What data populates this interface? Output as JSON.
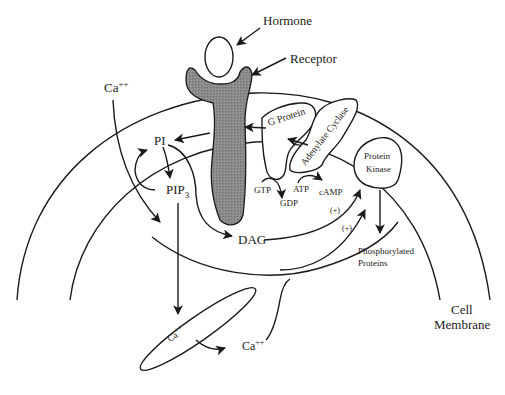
{
  "diagram": {
    "type": "signal-transduction",
    "colors": {
      "ink": "#1a1a1a",
      "receptor_fill": "#8a8a8a",
      "background": "#ffffff"
    },
    "labels": {
      "hormone": "Hormone",
      "receptor": "Receptor",
      "ca_outside": "Ca",
      "ca_outside_sup": "++",
      "pi": "PI",
      "pip": "PIP",
      "pip_sub": "3",
      "g_protein": "G Protein",
      "adenylate_cyclase": "Adenylate Cyclase",
      "gtp": "GTP",
      "gdp": "GDP",
      "atp": "ATP",
      "camp": "cAMP",
      "protein_kinase_line1": "Protein",
      "protein_kinase_line2": "Kinase",
      "plus1": "(+)",
      "plus2": "(+)",
      "dag": "DAG",
      "phosphorylated_line1": "Phosphorylated",
      "phosphorylated_line2": "Proteins",
      "ca_er": "Ca",
      "ca_er_sup": "++",
      "ca_released": "Ca",
      "ca_released_sup": "++",
      "cell_membrane_line1": "Cell",
      "cell_membrane_line2": "Membrane"
    },
    "nodes": [
      {
        "id": "hormone",
        "label": "Hormone"
      },
      {
        "id": "receptor",
        "label": "Receptor"
      },
      {
        "id": "g_protein",
        "label": "G Protein"
      },
      {
        "id": "adenylate_cyclase",
        "label": "Adenylate Cyclase"
      },
      {
        "id": "protein_kinase",
        "label": "Protein Kinase"
      },
      {
        "id": "pi",
        "label": "PI"
      },
      {
        "id": "pip3",
        "label": "PIP3"
      },
      {
        "id": "dag",
        "label": "DAG"
      },
      {
        "id": "er_calcium",
        "label": "Ca++"
      },
      {
        "id": "phosphorylated_proteins",
        "label": "Phosphorylated Proteins"
      }
    ],
    "edges": [
      {
        "from": "hormone",
        "to": "receptor"
      },
      {
        "from": "receptor",
        "to": "pi"
      },
      {
        "from": "adenylate_cyclase",
        "to": "g_protein"
      },
      {
        "from": "g_protein",
        "to": "receptor"
      },
      {
        "from": "pi",
        "to": "pip3"
      },
      {
        "from": "pip3",
        "to": "pi"
      },
      {
        "from": "pip3",
        "to": "dag"
      },
      {
        "from": "pip3",
        "to": "er_calcium"
      },
      {
        "from": "gtp",
        "to": "gdp"
      },
      {
        "from": "atp",
        "to": "camp"
      },
      {
        "from": "dag",
        "to": "protein_kinase",
        "label": "(+)"
      },
      {
        "from": "ca_released",
        "to": "protein_kinase",
        "label": "(+)"
      },
      {
        "from": "protein_kinase",
        "to": "phosphorylated_proteins"
      },
      {
        "from": "ca_outside",
        "to": "dag"
      }
    ]
  }
}
